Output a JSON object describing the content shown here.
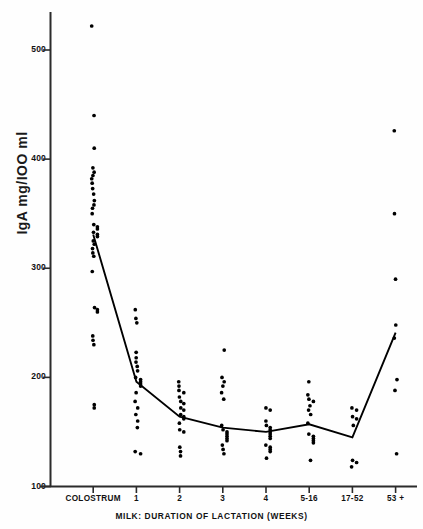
{
  "chart_data": {
    "type": "scatter",
    "title": "",
    "xlabel": "MILK:  DURATION OF LACTATION (WEEKS)",
    "ylabel": "IgA mg/IOO ml",
    "ylim": [
      100,
      530
    ],
    "yticks": [
      100,
      200,
      300,
      400,
      500
    ],
    "ytick_labels": [
      "100",
      "200",
      "300",
      "400",
      "500"
    ],
    "grid": false,
    "legend": null,
    "categories": [
      "COLOSTRUM",
      "1",
      "2",
      "3",
      "4",
      "5-16",
      "17-52",
      "53 +"
    ],
    "series": [
      {
        "name": "mean",
        "type": "line",
        "values": [
          331,
          196,
          164,
          154,
          150,
          157,
          145,
          241
        ]
      },
      {
        "name": "individual samples",
        "type": "scatter",
        "groups": [
          {
            "category": "COLOSTRUM",
            "values": [
              522,
              440,
              410,
              392,
              388,
              385,
              382,
              378,
              373,
              368,
              362,
              358,
              355,
              350,
              340,
              338,
              336,
              333,
              331,
              329,
              325,
              322,
              318,
              314,
              311,
              297,
              264,
              262,
              260,
              238,
              234,
              230,
              175,
              172
            ]
          },
          {
            "category": "1",
            "values": [
              262,
              254,
              250,
              223,
              218,
              214,
              210,
              206,
              200,
              198,
              196,
              194,
              192,
              186,
              178,
              172,
              166,
              160,
              154,
              132,
              130
            ]
          },
          {
            "category": "2",
            "values": [
              196,
              192,
              188,
              186,
              182,
              178,
              176,
              172,
              170,
              166,
              164,
              162,
              158,
              152,
              150,
              136,
              132,
              128
            ]
          },
          {
            "category": "3",
            "values": [
              225,
              200,
              196,
              192,
              186,
              180,
              156,
              152,
              150,
              148,
              146,
              144,
              142,
              138,
              134,
              130
            ]
          },
          {
            "category": "4",
            "values": [
              172,
              170,
              160,
              156,
              154,
              152,
              150,
              148,
              146,
              144,
              138,
              136,
              134,
              132,
              126
            ]
          },
          {
            "category": "5-16",
            "values": [
              196,
              184,
              180,
              178,
              174,
              170,
              166,
              158,
              148,
              146,
              144,
              142,
              140,
              124
            ]
          },
          {
            "category": "17-52",
            "values": [
              172,
              170,
              164,
              162,
              156,
              124,
              122,
              118
            ]
          },
          {
            "category": "53 +",
            "values": [
              426,
              350,
              290,
              248,
              236,
              198,
              188,
              130
            ]
          }
        ]
      }
    ]
  },
  "axis": {
    "y_title": "IgA mg/IOO ml",
    "x_title": "MILK:  DURATION OF LACTATION (WEEKS)"
  }
}
